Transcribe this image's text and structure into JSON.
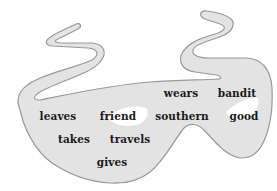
{
  "figure": {
    "colors": {
      "mask_fill": "#e3e3e3",
      "mask_outline": "#9a9a9a",
      "eye_fill": "#ffffff",
      "text": "#1a1a1a",
      "background": "#ffffff"
    },
    "words": [
      {
        "text": "wears",
        "x": 181,
        "y": 93
      },
      {
        "text": "bandit",
        "x": 237,
        "y": 93
      },
      {
        "text": "leaves",
        "x": 58,
        "y": 116
      },
      {
        "text": "friend",
        "x": 118,
        "y": 116
      },
      {
        "text": "southern",
        "x": 182,
        "y": 116
      },
      {
        "text": "good",
        "x": 244,
        "y": 116
      },
      {
        "text": "takes",
        "x": 74,
        "y": 139
      },
      {
        "text": "travels",
        "x": 130,
        "y": 139
      },
      {
        "text": "gives",
        "x": 112,
        "y": 162
      }
    ]
  }
}
